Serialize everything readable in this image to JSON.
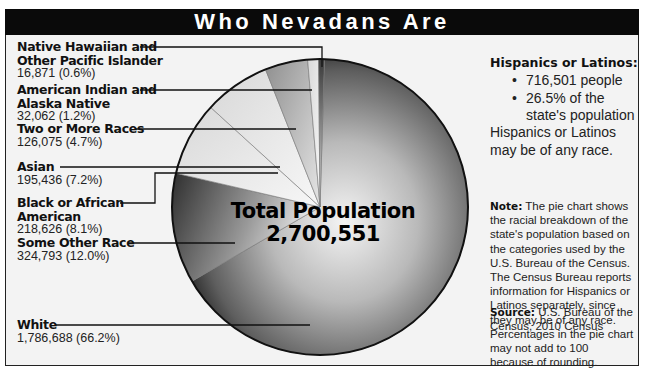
{
  "title": "Who Nevadans Are",
  "chart_data": {
    "type": "pie",
    "title": "Who Nevadans Are",
    "center_label": {
      "line1": "Total Population",
      "line2": "2,700,551"
    },
    "total": 2700551,
    "slices": [
      {
        "name": "White",
        "value": 1786688,
        "percent": 66.2,
        "value_label": "1,786,688 (66.2%)",
        "shade": "dark"
      },
      {
        "name": "Some Other Race",
        "value": 324793,
        "percent": 12.0,
        "value_label": "324,793 (12.0%)",
        "shade": "dark"
      },
      {
        "name": "Black or African American",
        "value": 218626,
        "percent": 8.1,
        "value_label": "218,626 (8.1%)",
        "shade": "light"
      },
      {
        "name": "Asian",
        "value": 195436,
        "percent": 7.2,
        "value_label": "195,436 (7.2%)",
        "shade": "light"
      },
      {
        "name": "Two or More Races",
        "value": 126075,
        "percent": 4.7,
        "value_label": "126,075 (4.7%)",
        "shade": "medium"
      },
      {
        "name": "American Indian and Alaska Native",
        "value": 32062,
        "percent": 1.2,
        "value_label": "32,062 (1.2%)",
        "shade": "light"
      },
      {
        "name": "Native Hawaiian and Other Pacific Islander",
        "value": 16871,
        "percent": 0.6,
        "value_label": "16,871 (0.6%)",
        "shade": "light"
      }
    ],
    "labels": [
      {
        "line1": "Native Hawaiian and",
        "line2": "Other Pacific Islander",
        "value_label": "16,871 (0.6%)"
      },
      {
        "line1": "American Indian and",
        "line2": "Alaska Native",
        "value_label": "32,062 (1.2%)"
      },
      {
        "line1": "Two or More Races",
        "line2": "",
        "value_label": "126,075 (4.7%)"
      },
      {
        "line1": "Asian",
        "line2": "",
        "value_label": "195,436 (7.2%)"
      },
      {
        "line1": "Black or African",
        "line2": "American",
        "value_label": "218,626 (8.1%)"
      },
      {
        "line1": "Some Other Race",
        "line2": "",
        "value_label": "324,793 (12.0%)"
      },
      {
        "line1": "White",
        "line2": "",
        "value_label": "1,786,688 (66.2%)"
      }
    ],
    "legend": "left-callouts"
  },
  "sidebar": {
    "hispanic_title": "Hispanics or Latinos:",
    "hispanic_bullets": [
      "716,501 people",
      "26.5% of the state's population"
    ],
    "hispanic_note": "Hispanics or Latinos may be of any race.",
    "note_label": "Note:",
    "note_text": " The pie chart shows the racial breakdown of the state's population based on the categories used by the U.S. Bureau of the Census. The Census Bureau reports information for Hispanics or Latinos separately, since they may be of any race. Percentages in the pie chart may not add to 100 because of rounding.",
    "source_label": "Source:",
    "source_text": " U.S. Bureau of the Census, 2010 Census"
  }
}
